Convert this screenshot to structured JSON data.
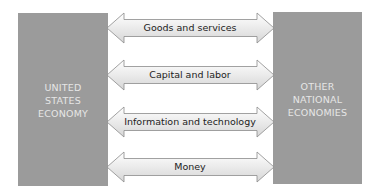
{
  "diagram": {
    "left_box": {
      "label": "UNITED\nSTATES\nECONOMY"
    },
    "right_box": {
      "label": "OTHER\nNATIONAL\nECONOMIES"
    },
    "flows": [
      {
        "label": "Goods and services",
        "direction": "bidirectional"
      },
      {
        "label": "Capital and labor",
        "direction": "bidirectional"
      },
      {
        "label": "Information and technology",
        "direction": "bidirectional"
      },
      {
        "label": "Money",
        "direction": "bidirectional"
      }
    ],
    "colors": {
      "box_fill": "#9b9b9b",
      "box_text": "#e6e6e6",
      "arrow_fill_top": "#ffffff",
      "arrow_fill_bottom": "#d9d9d9",
      "arrow_stroke": "#8a8a8a",
      "label_text": "#222222"
    }
  }
}
